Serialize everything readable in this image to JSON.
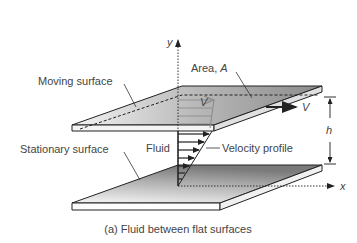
{
  "figure": {
    "caption": "(a) Fluid between flat surfaces",
    "labels": {
      "moving_surface": "Moving surface",
      "stationary_surface": "Stationary surface",
      "area": "Area, ",
      "area_symbol": "A",
      "fluid": "Fluid",
      "velocity_profile": "Velocity profile",
      "velocity_symbol": "V",
      "velocity_symbol_top": "V",
      "gap_symbol": "h",
      "y_axis": "y",
      "x_axis": "x"
    },
    "colors": {
      "plate_edge": "#222222",
      "plate_fill_dark": "#8a8a8a",
      "plate_fill_light": "#e8e8e8",
      "text": "#444444",
      "arrow": "#222222"
    }
  }
}
